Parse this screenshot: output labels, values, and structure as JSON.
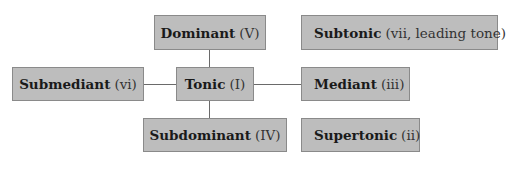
{
  "diagram": {
    "fill_color": "#bdbdbd",
    "border_color": "#8a8a8a",
    "nodes": {
      "dominant": {
        "name": "Dominant",
        "numeral": "(V)"
      },
      "subtonic": {
        "name": "Subtonic",
        "numeral": "(vii, leading tone)"
      },
      "submediant": {
        "name": "Submediant",
        "numeral": "(vi)"
      },
      "tonic": {
        "name": "Tonic",
        "numeral": "(I)"
      },
      "mediant": {
        "name": "Mediant",
        "numeral": "(iii)"
      },
      "subdominant": {
        "name": "Subdominant",
        "numeral": "(IV)"
      },
      "supertonic": {
        "name": "Supertonic",
        "numeral": "(ii)"
      }
    },
    "edges": [
      [
        "tonic",
        "dominant"
      ],
      [
        "tonic",
        "submediant"
      ],
      [
        "tonic",
        "mediant"
      ],
      [
        "tonic",
        "subdominant"
      ]
    ]
  }
}
